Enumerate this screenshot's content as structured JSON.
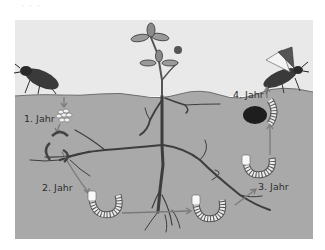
{
  "header": {
    "partial_caption": "· · ·"
  },
  "diagram": {
    "colors": {
      "sky": "#e9e9e9",
      "soil": "#a9a9a9",
      "ground_line": "#6e6e6e",
      "root": "#3d3d3d",
      "arrow": "#7a7a7a",
      "larva_body": "#ececec",
      "beetle": "#3a3a3a",
      "text": "#2e2e2e"
    },
    "stages": [
      {
        "id": "eggs",
        "label": "1. Jahr"
      },
      {
        "id": "larva2",
        "label": "2. Jahr"
      },
      {
        "id": "larva3",
        "label": "3. Jahr"
      },
      {
        "id": "pupa",
        "label": "4. Jahr"
      }
    ],
    "elements": {
      "beetle_left": "female beetle laying eggs",
      "beetle_right": "adult beetle emerging with wings",
      "plant": "plant with roots"
    }
  }
}
